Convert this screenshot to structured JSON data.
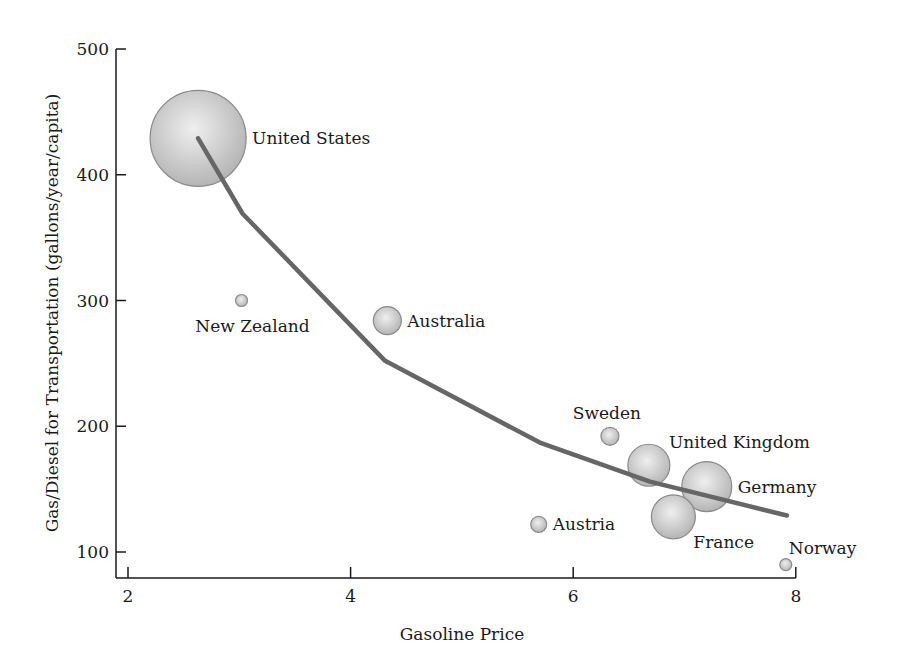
{
  "chart_data": {
    "type": "scatter",
    "subtype": "bubble-with-trend-line",
    "title": "",
    "xlabel": "Gasoline Price",
    "ylabel": "Gas/Diesel for Transportation (gallons/year/capita)",
    "xlim": [
      1.9,
      8.0
    ],
    "ylim": [
      80,
      500
    ],
    "xticks": [
      2,
      4,
      6,
      8
    ],
    "yticks": [
      100,
      200,
      300,
      400,
      500
    ],
    "grid": false,
    "legend": null,
    "points": [
      {
        "label": "United States",
        "x": 2.63,
        "y": 429,
        "size": 48,
        "label_pos": "right"
      },
      {
        "label": "New Zealand",
        "x": 3.02,
        "y": 300,
        "size": 6,
        "label_pos": "below"
      },
      {
        "label": "Australia",
        "x": 4.33,
        "y": 284,
        "size": 14,
        "label_pos": "right"
      },
      {
        "label": "Sweden",
        "x": 6.33,
        "y": 192,
        "size": 9,
        "label_pos": "above"
      },
      {
        "label": "United Kingdom",
        "x": 6.68,
        "y": 169,
        "size": 21,
        "label_pos": "upper-right"
      },
      {
        "label": "Germany",
        "x": 7.2,
        "y": 152,
        "size": 25,
        "label_pos": "right"
      },
      {
        "label": "France",
        "x": 6.9,
        "y": 128,
        "size": 22,
        "label_pos": "lower-right"
      },
      {
        "label": "Austria",
        "x": 5.69,
        "y": 122,
        "size": 8,
        "label_pos": "right"
      },
      {
        "label": "Norway",
        "x": 7.91,
        "y": 90,
        "size": 6,
        "label_pos": "above-right"
      }
    ],
    "trend_line": {
      "x": [
        2.63,
        3.03,
        4.31,
        5.7,
        6.69,
        7.92
      ],
      "y": [
        429,
        369,
        252,
        187,
        156,
        129
      ]
    },
    "colors": {
      "bubble_center": "#efefef",
      "bubble_edge": "#b5b5b5",
      "bubble_stroke": "#8a8a8a",
      "trend_line": "#666666",
      "axis": "#1a1a1a"
    }
  }
}
